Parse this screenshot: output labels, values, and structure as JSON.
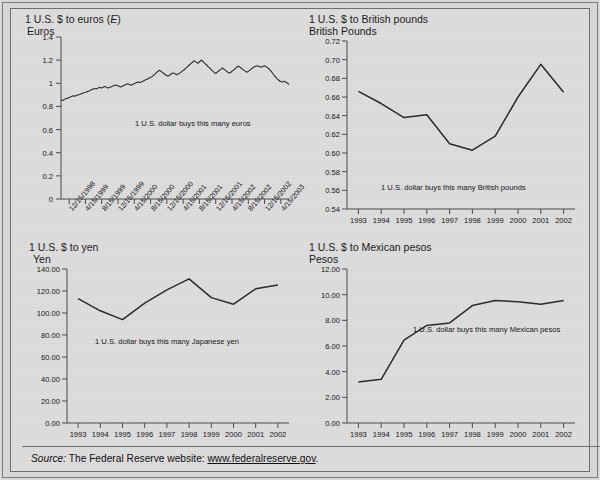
{
  "figure": {
    "background_color": "#dcdcdc",
    "line_color": "#2b2b2b",
    "axis_color": "#4a4a4a"
  },
  "source": {
    "label": "Source:",
    "text": "The Federal Reserve website:",
    "url": "www.federalreserve.gov",
    "period": "."
  },
  "chart_data": [
    {
      "id": "euro",
      "type": "line",
      "title": "1 U.S. $ to euros (E)",
      "title_plain": "1 U.S. $ to euros (",
      "title_italic": "E",
      "title_tail": ")",
      "ylabel": "Euros",
      "xlabel": "",
      "annotation": "1 U.S. dollar buys this many euros",
      "ylim": [
        0,
        1.4
      ],
      "yticks": [
        "0",
        "0.2",
        "0.4",
        "0.6",
        "0.8",
        "1",
        "1.2",
        "1.4"
      ],
      "ytickvals": [
        0,
        0.2,
        0.4,
        0.6,
        0.8,
        1.0,
        1.2,
        1.4
      ],
      "xticks": [
        "12/15/1998",
        "4/15/1999",
        "8/15/1999",
        "12/15/1999",
        "4/15/2000",
        "8/15/2000",
        "12/15/2000",
        "4/15/2001",
        "8/15/2001",
        "12/15/2001",
        "4/15/2002",
        "8/15/2002",
        "12/15/2002",
        "4/15/2003"
      ],
      "grid": false,
      "legend": "none",
      "x": [
        0,
        0.6,
        1.2,
        1.8,
        2.4,
        3,
        3.6,
        4.2,
        4.8,
        5.4,
        6,
        6.6,
        7.2,
        7.8,
        8.4,
        9,
        9.6,
        10.2,
        10.8,
        11.4,
        12,
        12.6,
        13.2,
        13.8,
        14.4,
        15,
        15.6,
        16.2,
        16.8,
        17.4,
        18,
        18.6,
        19.2,
        19.8,
        20.4,
        21,
        21.6,
        22.2,
        22.8,
        23.4,
        24,
        24.6,
        25.2,
        25.8,
        26.4,
        27,
        27.6,
        28.2,
        28.8,
        29.4,
        30,
        30.6,
        31.2,
        31.8,
        32.4,
        33,
        33.6,
        34.2,
        34.8,
        35.4,
        36,
        36.6,
        37.2,
        37.8,
        38.4,
        39,
        39.6,
        40.2,
        40.8,
        41.4,
        42,
        42.6,
        43.2,
        43.8,
        44.4,
        45,
        45.6,
        46.2,
        46.8,
        47.4,
        48,
        48.6,
        49.2,
        49.8,
        50.4,
        51,
        51.6,
        52.2,
        52.8,
        53.4,
        54,
        54.6,
        55.2,
        55.8,
        56.4,
        57,
        57.6,
        58.2,
        58.8,
        59.4,
        60,
        60.6,
        61.2,
        61.8,
        62.4,
        63,
        63.6,
        64.2,
        64.8,
        65.4,
        66,
        66.6,
        67.2,
        67.8,
        68.4,
        69,
        69.6,
        70.2,
        70.8,
        71.4,
        72,
        72.6,
        73.2,
        73.8,
        74.4,
        75,
        75.6,
        76.2,
        76.8,
        77.4,
        78
      ],
      "values": [
        0.855,
        0.852,
        0.861,
        0.868,
        0.872,
        0.88,
        0.886,
        0.892,
        0.889,
        0.896,
        0.9,
        0.906,
        0.912,
        0.918,
        0.921,
        0.928,
        0.934,
        0.941,
        0.948,
        0.955,
        0.951,
        0.958,
        0.965,
        0.959,
        0.966,
        0.972,
        0.965,
        0.959,
        0.966,
        0.972,
        0.979,
        0.985,
        0.98,
        0.974,
        0.968,
        0.975,
        0.982,
        0.989,
        0.996,
        0.99,
        0.984,
        0.991,
        0.998,
        1.005,
        1.012,
        1.006,
        1.013,
        1.02,
        1.028,
        1.035,
        1.043,
        1.05,
        1.06,
        1.072,
        1.085,
        1.1,
        1.112,
        1.104,
        1.092,
        1.08,
        1.07,
        1.062,
        1.072,
        1.082,
        1.09,
        1.082,
        1.074,
        1.082,
        1.092,
        1.103,
        1.115,
        1.128,
        1.142,
        1.156,
        1.17,
        1.182,
        1.196,
        1.185,
        1.172,
        1.186,
        1.2,
        1.188,
        1.172,
        1.158,
        1.142,
        1.128,
        1.112,
        1.098,
        1.085,
        1.095,
        1.108,
        1.12,
        1.132,
        1.122,
        1.11,
        1.098,
        1.088,
        1.098,
        1.11,
        1.122,
        1.136,
        1.148,
        1.14,
        1.128,
        1.116,
        1.105,
        1.095,
        1.105,
        1.118,
        1.13,
        1.14,
        1.148,
        1.152,
        1.146,
        1.138,
        1.146,
        1.152,
        1.144,
        1.132,
        1.118,
        1.1,
        1.08,
        1.06,
        1.042,
        1.028,
        1.018,
        1.01,
        1.018,
        1.012,
        1.002,
        0.992,
        0.982,
        0.968,
        0.95,
        0.932,
        0.918,
        0.925,
        0.918,
        0.928
      ]
    },
    {
      "id": "pound",
      "type": "line",
      "title": "1 U.S. $ to British pounds",
      "ylabel": "British Pounds",
      "xlabel": "",
      "annotation": "1 U.S. dollar buys this many British pounds",
      "ylim": [
        0.54,
        0.72
      ],
      "yticks": [
        "0.54",
        "0.56",
        "0.58",
        "0.60",
        "0.62",
        "0.64",
        "0.66",
        "0.68",
        "0.70",
        "0.72"
      ],
      "ytickvals": [
        0.54,
        0.56,
        0.58,
        0.6,
        0.62,
        0.64,
        0.66,
        0.68,
        0.7,
        0.72
      ],
      "xticks": [
        "1993",
        "1994",
        "1995",
        "1996",
        "1997",
        "1998",
        "1999",
        "2000",
        "2001",
        "2002"
      ],
      "grid": false,
      "legend": "none",
      "categories": [
        1993,
        1994,
        1995,
        1996,
        1997,
        1998,
        1999,
        2000,
        2001,
        2002
      ],
      "values": [
        0.666,
        0.653,
        0.638,
        0.641,
        0.61,
        0.603,
        0.618,
        0.66,
        0.695,
        0.665
      ]
    },
    {
      "id": "yen",
      "type": "line",
      "title": "1 U.S. $ to yen",
      "ylabel": "Yen",
      "xlabel": "",
      "annotation": "1 U.S. dollar buys this many Japanese yen",
      "ylim": [
        0,
        140
      ],
      "yticks": [
        "0.00",
        "20.00",
        "40.00",
        "60.00",
        "80.00",
        "100.00",
        "120.00",
        "140.00"
      ],
      "ytickvals": [
        0,
        20,
        40,
        60,
        80,
        100,
        120,
        140
      ],
      "xticks": [
        "1993",
        "1994",
        "1995",
        "1996",
        "1997",
        "1998",
        "1999",
        "2000",
        "2001",
        "2002"
      ],
      "grid": false,
      "legend": "none",
      "categories": [
        1993,
        1994,
        1995,
        1996,
        1997,
        1998,
        1999,
        2000,
        2001,
        2002
      ],
      "values": [
        113.0,
        102.0,
        94.0,
        109.0,
        121.0,
        131.0,
        114.0,
        108.0,
        122.0,
        125.5
      ]
    },
    {
      "id": "peso",
      "type": "line",
      "title": "1 U.S. $ to Mexican pesos",
      "ylabel": "Pesos",
      "xlabel": "",
      "annotation": "1 U.S. dollar buys this many Mexican pesos",
      "ylim": [
        0,
        12
      ],
      "yticks": [
        "0.00",
        "2.00",
        "4.00",
        "6.00",
        "8.00",
        "10.00",
        "12.00"
      ],
      "ytickvals": [
        0,
        2,
        4,
        6,
        8,
        10,
        12
      ],
      "xticks": [
        "1993",
        "1994",
        "1995",
        "1996",
        "1997",
        "1998",
        "1999",
        "2000",
        "2001",
        "2002"
      ],
      "grid": false,
      "legend": "none",
      "categories": [
        1993,
        1994,
        1995,
        1996,
        1997,
        1998,
        1999,
        2000,
        2001,
        2002
      ],
      "values": [
        3.2,
        3.4,
        6.45,
        7.6,
        7.8,
        9.15,
        9.55,
        9.45,
        9.25,
        9.55
      ]
    }
  ]
}
